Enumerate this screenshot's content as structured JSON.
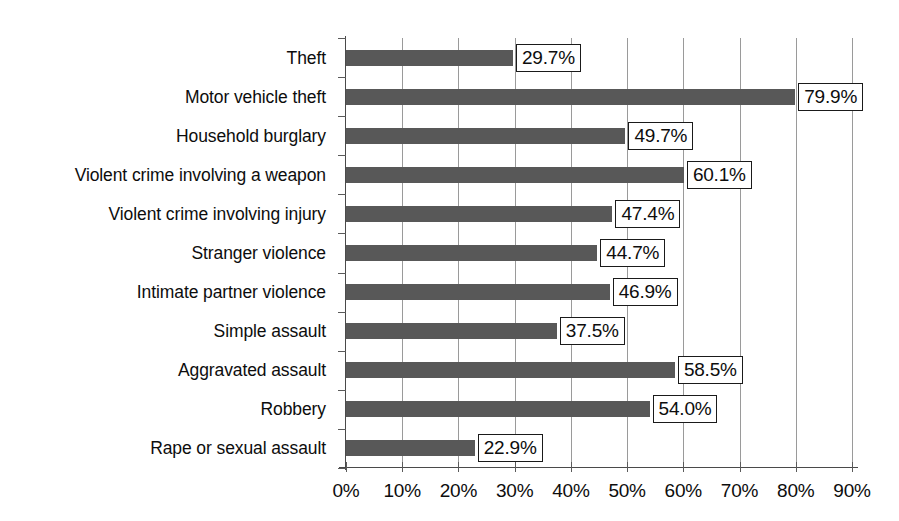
{
  "chart_data": {
    "type": "bar",
    "orientation": "horizontal",
    "title": "",
    "subtitle": "",
    "xlabel": "",
    "ylabel": "",
    "xlim": [
      0,
      90
    ],
    "ylim": null,
    "grid": true,
    "gridlines": "vertical",
    "legend": null,
    "legend_position": "none",
    "xtick_labels": [
      "0%",
      "10%",
      "20%",
      "30%",
      "40%",
      "50%",
      "60%",
      "70%",
      "80%",
      "90%"
    ],
    "xtick_values": [
      0,
      10,
      20,
      30,
      40,
      50,
      60,
      70,
      80,
      90
    ],
    "value_suffix": "%",
    "categories": [
      "Theft",
      "Motor vehicle theft",
      "Household burglary",
      "Violent crime involving a weapon",
      "Violent crime involving injury",
      "Stranger violence",
      "Intimate partner violence",
      "Simple assault",
      "Aggravated assault",
      "Robbery",
      "Rape or sexual assault"
    ],
    "values": [
      29.7,
      79.9,
      49.7,
      60.1,
      47.4,
      44.7,
      46.9,
      37.5,
      58.5,
      54.0,
      22.9
    ],
    "data_labels": [
      "29.7%",
      "79.9%",
      "49.7%",
      "60.1%",
      "47.4%",
      "44.7%",
      "46.9%",
      "37.5%",
      "58.5%",
      "54.0%",
      "22.9%"
    ],
    "colors": {
      "bar": "#585858",
      "gridline": "#9a9a9a",
      "axis": "#4a4a4a",
      "label_box_border": "#1a1a1a",
      "label_box_fill": "#ffffff",
      "text": "#0d0d0d",
      "background": "#ffffff"
    }
  }
}
